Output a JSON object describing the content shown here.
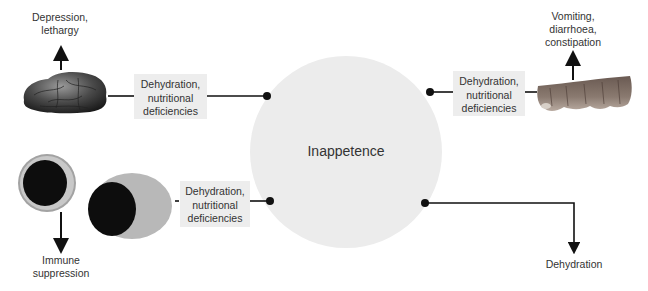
{
  "center": {
    "label": "Inappetence",
    "fill": "#ececec"
  },
  "nodes": {
    "brain": {
      "effect_lines": [
        "Depression,",
        "lethargy"
      ],
      "box_lines": [
        "Dehydration,",
        "nutritional",
        "deficiencies"
      ]
    },
    "intestine": {
      "effect_lines": [
        "Vomiting,",
        "diarrhoea,",
        "constipation"
      ],
      "box_lines": [
        "Dehydration,",
        "nutritional",
        "deficiencies"
      ]
    },
    "cells": {
      "effect_lines": [
        "Immune",
        "suppression"
      ],
      "box_lines": [
        "Dehydration,",
        "nutritional",
        "deficiencies"
      ]
    },
    "direct": {
      "effect_lines": [
        "Dehydration"
      ]
    }
  },
  "colors": {
    "line": "#111111",
    "box": "#ededed",
    "text": "#333333"
  }
}
